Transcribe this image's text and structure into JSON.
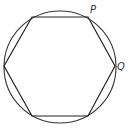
{
  "diagram": {
    "circle": {
      "cx": 60,
      "cy": 67,
      "r": 56,
      "stroke": "#333333"
    },
    "hexagon": {
      "vertices": [
        [
          32,
          17
        ],
        [
          88,
          17
        ],
        [
          115,
          66
        ],
        [
          88,
          116
        ],
        [
          32,
          116
        ],
        [
          4,
          66
        ]
      ],
      "stroke": "#222222"
    },
    "labels": [
      {
        "text": "P",
        "x": 90,
        "y": 13,
        "vertex": 1
      },
      {
        "text": "Q",
        "x": 117,
        "y": 70,
        "vertex": 2
      }
    ]
  }
}
